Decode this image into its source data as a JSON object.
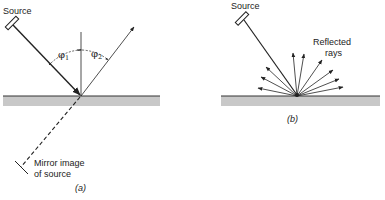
{
  "panel_a": {
    "source_label": "Source",
    "angle_incident": "φ",
    "angle_incident_sub": "1",
    "angle_reflected": "φ",
    "angle_reflected_sub": "2",
    "mirror_label_line1": "Mirror image",
    "mirror_label_line2": "of source",
    "caption": "(a)"
  },
  "panel_b": {
    "source_label": "Source",
    "reflected_label_line1": "Reflected",
    "reflected_label_line2": "rays",
    "caption": "(b)"
  },
  "colors": {
    "surface_fill": "#c8c8c8",
    "surface_edge": "#333333",
    "line": "#222222"
  }
}
